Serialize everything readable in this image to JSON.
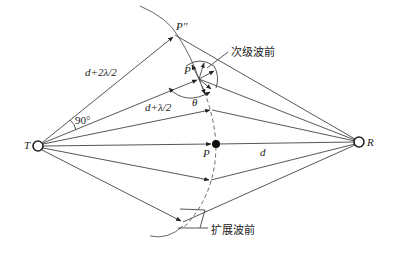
{
  "diagram": {
    "nodes": {
      "transmitter": {
        "label": "T"
      },
      "receiver": {
        "label": "R"
      },
      "point_p": {
        "label": "P"
      },
      "point_p_prime": {
        "label": "P'"
      },
      "point_p_double_prime": {
        "label": "P''"
      }
    },
    "labels": {
      "path_2": "d+2λ/2",
      "path_1": "d+λ/2",
      "direct": "d",
      "angle_90": "90°",
      "theta": "θ",
      "secondary_wavefront": "次级波前",
      "extended_wavefront": "扩展波前"
    },
    "colors": {
      "line": "#444444",
      "text": "#222222",
      "background": "#ffffff"
    }
  }
}
